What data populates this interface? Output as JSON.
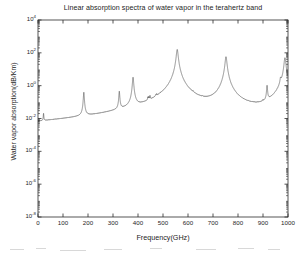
{
  "chart_data": {
    "type": "line",
    "title": "Linear absorption spectra of water vapor in the terahertz band",
    "xlabel": "Frequency(GHz)",
    "ylabel": "Water vapor absorption(dB/Km)",
    "yscale": "log",
    "xlim": [
      0,
      1000
    ],
    "ylim": [
      1e-08,
      10000.0
    ],
    "grid": false,
    "legend": null,
    "xticks": [
      0,
      100,
      200,
      300,
      400,
      500,
      600,
      700,
      800,
      900,
      1000
    ],
    "xticklabels": [
      "0",
      "100",
      "200",
      "300",
      "400",
      "500",
      "600",
      "700",
      "800",
      "900",
      "1000"
    ],
    "yticks": [
      1e-08,
      1e-06,
      0.0001,
      0.01,
      1.0,
      100.0,
      10000.0
    ],
    "yticklabels": [
      "10-8",
      "10-6",
      "10-4",
      "10-2",
      "100",
      "102",
      "104"
    ],
    "ytick_mantissa": "10",
    "ytick_exponents": [
      "-8",
      "-6",
      "-4",
      "-2",
      "0",
      "2",
      "4"
    ],
    "line_color": "#3a3a3a",
    "series_name": "water vapor absorption",
    "absorption_lines_ghz": [
      22.2,
      67.8,
      119.9,
      183.3,
      325.2,
      380.2,
      439.2,
      443.0,
      448.0,
      470.9,
      474.7,
      488.5,
      556.9,
      620.7,
      658.0,
      752.0,
      841.0,
      859.9,
      899.3,
      916.2,
      970.3,
      987.9
    ],
    "peak_values_db_per_km": [
      0.013,
      0.00035,
      0.00025,
      0.38,
      0.42,
      3.2,
      0.07,
      0.075,
      0.1,
      0.05,
      0.07,
      0.03,
      160.0,
      0.06,
      0.015,
      58.0,
      0.0045,
      0.006,
      0.02,
      0.9,
      1.6,
      50.0
    ],
    "baseline_values": [
      {
        "f": 0,
        "y": 3e-05
      },
      {
        "f": 10,
        "y": 3e-05
      },
      {
        "f": 40,
        "y": 0.00011
      },
      {
        "f": 100,
        "y": 0.00014
      },
      {
        "f": 160,
        "y": 0.00019
      },
      {
        "f": 250,
        "y": 0.00022
      },
      {
        "f": 300,
        "y": 0.0004
      },
      {
        "f": 400,
        "y": 0.0018
      },
      {
        "f": 500,
        "y": 0.006
      },
      {
        "f": 600,
        "y": 0.004
      },
      {
        "f": 700,
        "y": 0.0035
      },
      {
        "f": 800,
        "y": 0.0022
      },
      {
        "f": 900,
        "y": 0.006
      },
      {
        "f": 1000,
        "y": 0.6
      }
    ]
  },
  "figure": {
    "background_color": "#ffffff",
    "axis_color": "#2b2b2b"
  }
}
